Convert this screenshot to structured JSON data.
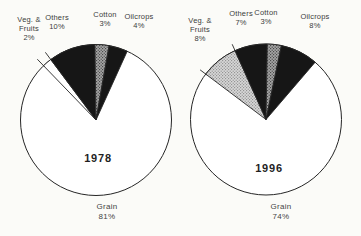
{
  "page": {
    "background": "#fbfbf8"
  },
  "colors": {
    "black": "#161616",
    "outline": "#262626",
    "white": "#ffffff",
    "speckle_dark_base": "#a6a6a6",
    "speckle_dark_dot": "#4a4a4a",
    "speckle_light_base": "#d8d8d8",
    "speckle_light_dot": "#949494",
    "text": "#3c3c3c"
  },
  "chart_data": [
    {
      "type": "pie",
      "title": "1978",
      "categories": [
        "Veg. & Fruits",
        "Others",
        "Cotton",
        "Oilcrops",
        "Grain"
      ],
      "values": [
        2,
        10,
        3,
        4,
        81
      ],
      "unit": "%",
      "legend_position": "none",
      "start_angle_deg": -44,
      "geometry": {
        "cx": 96,
        "cy": 120,
        "r": 75.5
      },
      "slices": [
        {
          "name": "veg-fruits",
          "value": 2,
          "fill": "white",
          "extend_edges": true,
          "extend_len": 9
        },
        {
          "name": "others",
          "value": 10,
          "fill": "black"
        },
        {
          "name": "cotton",
          "value": 3,
          "fill": "speckle-dark"
        },
        {
          "name": "oilcrops",
          "value": 4,
          "fill": "black"
        },
        {
          "name": "grain",
          "value": 81,
          "fill": "white"
        }
      ],
      "labels": {
        "veg": [
          "Veg. &",
          "Fruits",
          "2%"
        ],
        "others": [
          "Others",
          "10%"
        ],
        "cotton": [
          "Cotton",
          "3%"
        ],
        "oilcrops": [
          "Oilcrops",
          "4%"
        ],
        "grain": [
          "Grain",
          "81%"
        ],
        "year": "1978"
      }
    },
    {
      "type": "pie",
      "title": "1996",
      "categories": [
        "Veg. & Fruits",
        "Others",
        "Cotton",
        "Oilcrops",
        "Grain"
      ],
      "values": [
        8,
        7,
        3,
        8,
        74
      ],
      "unit": "%",
      "legend_position": "none",
      "start_angle_deg": -53,
      "geometry": {
        "cx": 266,
        "cy": 119.5,
        "r": 75.5
      },
      "slices": [
        {
          "name": "veg-fruits",
          "value": 8,
          "fill": "speckle-light",
          "extend_edges": true,
          "extend_len": 7
        },
        {
          "name": "others",
          "value": 7,
          "fill": "black"
        },
        {
          "name": "cotton",
          "value": 3,
          "fill": "speckle-dark"
        },
        {
          "name": "oilcrops",
          "value": 8,
          "fill": "black"
        },
        {
          "name": "grain",
          "value": 74,
          "fill": "white"
        }
      ],
      "labels": {
        "veg": [
          "Veg. &",
          "Fruits",
          "8%"
        ],
        "others": [
          "Others",
          "7%"
        ],
        "cotton": [
          "Cotton",
          "3%"
        ],
        "oilcrops": [
          "Oilcrops",
          "8%"
        ],
        "grain": [
          "Grain",
          "74%"
        ],
        "year": "1996"
      }
    }
  ]
}
